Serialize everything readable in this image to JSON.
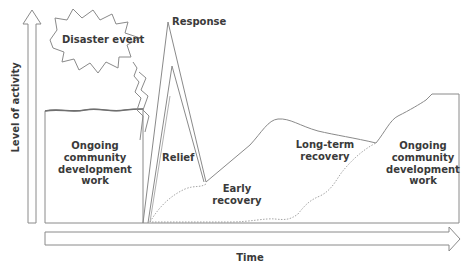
{
  "diagram": {
    "y_axis_label": "Level of activity",
    "x_axis_label": "Time",
    "labels": {
      "disaster_event": "Disaster event",
      "response": "Response",
      "relief": "Relief",
      "early_recovery_1": "Early",
      "early_recovery_2": "recovery",
      "long_term_1": "Long-term",
      "long_term_2": "recovery",
      "ongoing_left_1": "Ongoing",
      "ongoing_left_2": "community",
      "ongoing_left_3": "development",
      "ongoing_left_4": "work",
      "ongoing_right_1": "Ongoing",
      "ongoing_right_2": "community",
      "ongoing_right_3": "development",
      "ongoing_right_4": "work"
    },
    "colors": {
      "line": "#8a8a8a",
      "text": "#3a3a3a",
      "background": "#ffffff"
    }
  }
}
